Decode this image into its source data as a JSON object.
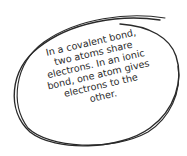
{
  "note": {
    "lines": [
      "In a covalent bond,",
      "two atoms share",
      "electrons. In an ionic",
      "bond, one atom gives",
      "electrons to the",
      "other."
    ],
    "ink_color": "#2a2a2a"
  }
}
